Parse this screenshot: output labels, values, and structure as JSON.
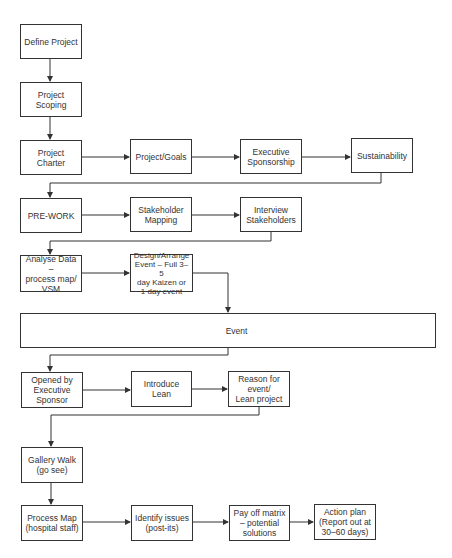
{
  "diagram": {
    "type": "flowchart",
    "nodes": [
      {
        "id": "define_project",
        "label": "Define Project"
      },
      {
        "id": "project_scoping",
        "label": "Project Scoping"
      },
      {
        "id": "project_charter",
        "label": "Project Charter"
      },
      {
        "id": "project_goals",
        "label": "Project/Goals"
      },
      {
        "id": "executive_sponsorship",
        "label": "Executive\nSponsorship"
      },
      {
        "id": "sustainability",
        "label": "Sustainability"
      },
      {
        "id": "pre_work",
        "label": "PRE-WORK"
      },
      {
        "id": "stakeholder_mapping",
        "label": "Stakeholder\nMapping"
      },
      {
        "id": "interview_stakeholders",
        "label": "Interview\nStakeholders"
      },
      {
        "id": "analyse_data",
        "label": "Analyse Data –\nprocess map/\nVSM"
      },
      {
        "id": "design_arrange_event",
        "label": "Design/Arrange\nEvent – Full 3–5\nday Kaizen or\n1 day event"
      },
      {
        "id": "event",
        "label": "Event"
      },
      {
        "id": "opened_by_exec",
        "label": "Opened by\nExecutive\nSponsor"
      },
      {
        "id": "introduce_lean",
        "label": "Introduce Lean"
      },
      {
        "id": "reason_for_event",
        "label": "Reason for\nevent/\nLean project"
      },
      {
        "id": "gallery_walk",
        "label": "Gallery Walk\n(go see)"
      },
      {
        "id": "process_map",
        "label": "Process Map\n(hospital staff)"
      },
      {
        "id": "identify_issues",
        "label": "Identify issues\n(post-its)"
      },
      {
        "id": "pay_off_matrix",
        "label": "Pay off matrix\n– potential\nsolutions"
      },
      {
        "id": "action_plan",
        "label": "Action plan\n(Report out at\n30–60 days)"
      }
    ],
    "edges": [
      [
        "define_project",
        "project_scoping"
      ],
      [
        "project_scoping",
        "project_charter"
      ],
      [
        "project_charter",
        "project_goals"
      ],
      [
        "project_goals",
        "executive_sponsorship"
      ],
      [
        "executive_sponsorship",
        "sustainability"
      ],
      [
        "sustainability",
        "pre_work"
      ],
      [
        "pre_work",
        "stakeholder_mapping"
      ],
      [
        "stakeholder_mapping",
        "interview_stakeholders"
      ],
      [
        "interview_stakeholders",
        "analyse_data"
      ],
      [
        "analyse_data",
        "design_arrange_event"
      ],
      [
        "design_arrange_event",
        "event"
      ],
      [
        "event",
        "opened_by_exec"
      ],
      [
        "opened_by_exec",
        "introduce_lean"
      ],
      [
        "introduce_lean",
        "reason_for_event"
      ],
      [
        "reason_for_event",
        "gallery_walk"
      ],
      [
        "gallery_walk",
        "process_map"
      ],
      [
        "process_map",
        "identify_issues"
      ],
      [
        "identify_issues",
        "pay_off_matrix"
      ],
      [
        "pay_off_matrix",
        "action_plan"
      ]
    ]
  }
}
